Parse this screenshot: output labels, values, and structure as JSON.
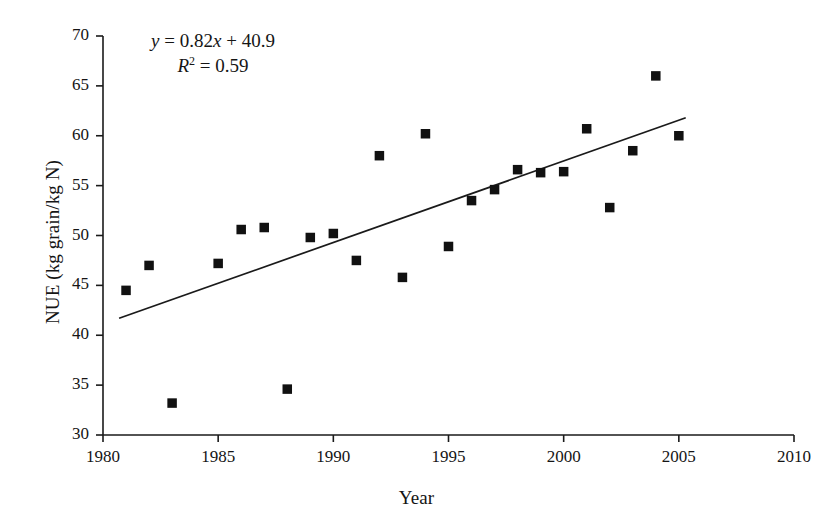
{
  "chart_data": {
    "type": "scatter",
    "title": "",
    "xlabel": "Year",
    "ylabel": "NUE (kg grain/kg N)",
    "xlim": [
      1980,
      2010
    ],
    "ylim": [
      30,
      70
    ],
    "xticks": [
      1980,
      1985,
      1990,
      1995,
      2000,
      2005,
      2010
    ],
    "yticks": [
      30,
      35,
      40,
      45,
      50,
      55,
      60,
      65,
      70
    ],
    "grid": false,
    "legend": null,
    "marker": "filled-square",
    "marker_color": "#111111",
    "x": [
      1981,
      1982,
      1983,
      1985,
      1986,
      1987,
      1988,
      1989,
      1990,
      1991,
      1992,
      1993,
      1994,
      1995,
      1996,
      1997,
      1998,
      1999,
      2000,
      2001,
      2002,
      2003,
      2004,
      2005
    ],
    "y": [
      44.5,
      47.0,
      33.2,
      47.2,
      50.6,
      50.8,
      34.6,
      49.8,
      50.2,
      47.5,
      58.0,
      45.8,
      60.2,
      48.9,
      53.5,
      54.6,
      56.6,
      56.3,
      56.4,
      60.7,
      52.8,
      58.5,
      66.0,
      60.0
    ],
    "trendline": {
      "slope": 0.82,
      "intercept": 40.9,
      "r_squared": 0.59,
      "x_start": 1980.7,
      "x_end": 2005.3,
      "y_start": 41.7,
      "y_end": 61.8,
      "color": "#1a1a1a"
    },
    "annotations": {
      "equation_y": "y",
      "equation_rest": " = 0.82x + 40.9",
      "equation_full": "y = 0.82x + 40.9",
      "r2_symbol": "R",
      "r2_exponent": "2",
      "r2_rest": " = 0.59",
      "r2_full": "R2 = 0.59"
    }
  },
  "axes": {
    "y_tick_labels": [
      "70",
      "65",
      "60",
      "55",
      "50",
      "45",
      "40",
      "35",
      "30"
    ],
    "x_tick_labels": [
      "1980",
      "1985",
      "1990",
      "1995",
      "2000",
      "2005",
      "2010"
    ],
    "x_title": "Year",
    "y_title": "NUE (kg grain/kg N)"
  }
}
